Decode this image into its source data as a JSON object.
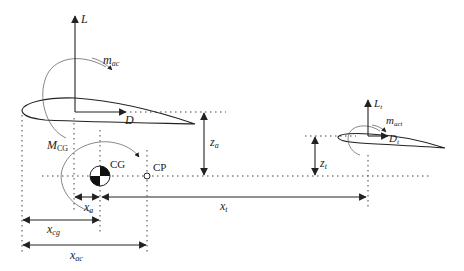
{
  "diagram": {
    "colors": {
      "ink": "#222222",
      "background": "#ffffff"
    },
    "wing": {
      "lift_label": "L",
      "drag_label": "D",
      "moment_label_main": "m",
      "moment_label_sub": "ac"
    },
    "tail": {
      "lift_label_main": "L",
      "lift_label_sub": "t",
      "drag_label_main": "D",
      "drag_label_sub": "t",
      "moment_label_main": "m",
      "moment_label_sub": "act"
    },
    "cg": {
      "moment_label_main": "M",
      "moment_label_sub": "CG",
      "cg_label": "CG",
      "cp_label": "CP"
    },
    "dimensions": {
      "z_a_main": "z",
      "z_a_sub": "a",
      "z_t_main": "z",
      "z_t_sub": "t",
      "x_a_main": "x",
      "x_a_sub": "a",
      "x_t_main": "x",
      "x_t_sub": "t",
      "x_cg_main": "x",
      "x_cg_sub": "cg",
      "x_ac_main": "x",
      "x_ac_sub": "ac"
    }
  }
}
